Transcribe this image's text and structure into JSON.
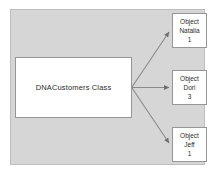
{
  "diagram": {
    "panel": {
      "background_color": "#d6d6d6",
      "border_color": "#bdbdbd"
    },
    "class_node": {
      "label": "DNACustomers Class",
      "fill_color": "#ffffff",
      "border_color": "#969696"
    },
    "object_nodes": [
      {
        "kind_label": "Object",
        "name_label": "Natalia",
        "id_label": "1"
      },
      {
        "kind_label": "Object",
        "name_label": "Dori",
        "id_label": "3"
      },
      {
        "kind_label": "Object",
        "name_label": "Jeff",
        "id_label": "1"
      }
    ],
    "connectors": [
      {
        "name": "arrow-to-natalia",
        "direction": "up-right"
      },
      {
        "name": "arrow-to-dori",
        "direction": "right"
      },
      {
        "name": "arrow-to-jeff",
        "direction": "down-right"
      }
    ],
    "connector_color": "#7a7a7a"
  }
}
